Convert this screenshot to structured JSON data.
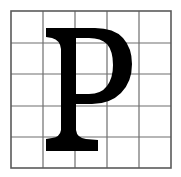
{
  "figure": {
    "name": "gridded-glyph-sample",
    "character": "P",
    "script": "Latin",
    "case": "uppercase",
    "typeface_style": "serif",
    "background_color": "#ffffff",
    "glyph_color": "#000000",
    "canvas": {
      "width": 181,
      "height": 177
    }
  },
  "grid": {
    "columns": 5,
    "rows": 5,
    "line_color": "#6e6e6e",
    "border_color": "#5a5a5a",
    "line_width": 1.2,
    "border_width": 1.6,
    "x_positions": [
      11,
      43,
      75,
      107,
      139,
      171
    ],
    "y_positions": [
      11,
      43,
      74,
      106,
      137,
      168
    ],
    "cell_fill": "#ffffff"
  },
  "glyph": {
    "label": "P",
    "bounds": {
      "left": 46,
      "top": 28,
      "right": 129,
      "bottom": 151
    },
    "stem": {
      "left": 61,
      "right": 76,
      "width": 15
    },
    "top_serif": {
      "left": 46,
      "right": 79,
      "top": 28,
      "thickness": 9
    },
    "foot_serif": {
      "left": 46,
      "right": 98,
      "baseline": 151,
      "thickness": 12
    },
    "bowl": {
      "right_extent": 129,
      "top": 29,
      "bottom": 105
    },
    "counter": {
      "left": 76,
      "top": 40,
      "right": 113,
      "bottom": 93
    },
    "path": "M 46 151 L 46 139 L 52 138 Q 60 137 61 130 L 61 49 Q 60 40 52 38 L 46 37 L 46 28 L 95 28 Q 114 28 123 38 Q 132 48 132 64 Q 132 82 121 93 Q 110 104 92 104 L 76 104 L 76 130 Q 77 138 86 139 L 98 140 L 98 151 Z M 76 38 L 76 94 L 89 94 Q 101 94 107 86 Q 113 78 113 65 Q 113 51 107 44 Q 101 38 89 38 Z"
  }
}
